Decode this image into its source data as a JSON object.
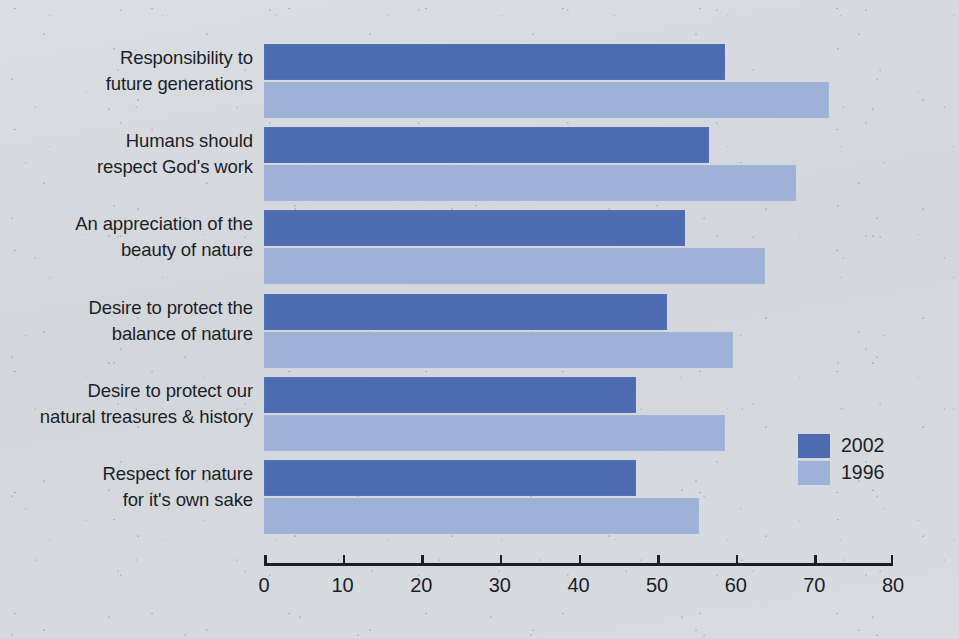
{
  "chart_data": {
    "type": "bar",
    "orientation": "horizontal",
    "title": "",
    "subtitle": "",
    "xlabel": "",
    "ylabel": "",
    "xlim": [
      0,
      80
    ],
    "grid": false,
    "legend_position": "right",
    "axis_ticks": [
      "0",
      "10",
      "20",
      "30",
      "40",
      "50",
      "60",
      "70",
      "80"
    ],
    "tick_values": [
      0,
      10,
      20,
      30,
      40,
      50,
      60,
      70,
      80
    ],
    "categories": [
      "Responsibility to future generations",
      "Humans should respect God's work",
      "An appreciation of the beauty of nature",
      "Desire to protect the balance of nature",
      "Desire to protect our natural treasures & history",
      "Respect for nature for it's own sake"
    ],
    "category_lines": [
      [
        "Responsibility to",
        "future generations"
      ],
      [
        "Humans should",
        "respect God's work"
      ],
      [
        "An appreciation of the",
        "beauty of nature"
      ],
      [
        "Desire to protect the",
        "balance of nature"
      ],
      [
        "Desire to protect our",
        "natural treasures & history"
      ],
      [
        "Respect for nature",
        "for it's own sake"
      ]
    ],
    "series": [
      {
        "name": "2002",
        "color": "#4d6bb0",
        "values": [
          58.6,
          56.6,
          53.6,
          51.3,
          47.3,
          47.3
        ]
      },
      {
        "name": "1996",
        "color": "#9eb2d7",
        "values": [
          71.8,
          67.7,
          63.7,
          59.7,
          58.6,
          55.3
        ]
      }
    ]
  },
  "legend": {
    "entries": [
      {
        "label": "2002",
        "color": "#4d6bb0"
      },
      {
        "label": "1996",
        "color": "#9eb2d7"
      }
    ]
  },
  "colors": {
    "series_2002": "#4d6bb0",
    "series_1996": "#9eb2d7",
    "background": "#d7dbdf",
    "text": "#1b1f27",
    "axis": "#1b1f27"
  }
}
